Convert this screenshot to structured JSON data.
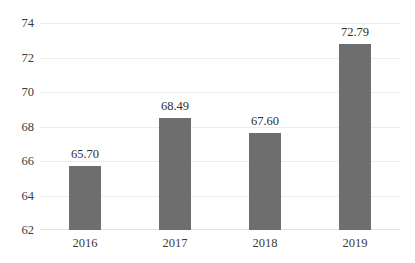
{
  "chart_data": {
    "type": "bar",
    "title": "",
    "subtitle": "",
    "xlabel": "",
    "ylabel": "",
    "categories": [
      "2016",
      "2017",
      "2018",
      "2019"
    ],
    "values": [
      65.7,
      68.49,
      67.6,
      72.79
    ],
    "data_labels": [
      "65.70",
      "68.49",
      "67.60",
      "72.79"
    ],
    "ylim": [
      62,
      74
    ],
    "y_ticks": [
      62,
      64,
      66,
      68,
      70,
      72,
      74
    ],
    "y_tick_labels": [
      "62",
      "64",
      "66",
      "68",
      "70",
      "72",
      "74"
    ],
    "grid": true,
    "grid_axis": "y",
    "legend": false,
    "legend_position": "none",
    "series": [
      {
        "name": "",
        "values": [
          65.7,
          68.49,
          67.6,
          72.79
        ]
      }
    ]
  },
  "style": {
    "bar_color": "#6e6e6e",
    "grid_color": "#ececec",
    "text_color": "#3b3b3b",
    "label_color": "#2f2f2f",
    "background": "#ffffff"
  }
}
